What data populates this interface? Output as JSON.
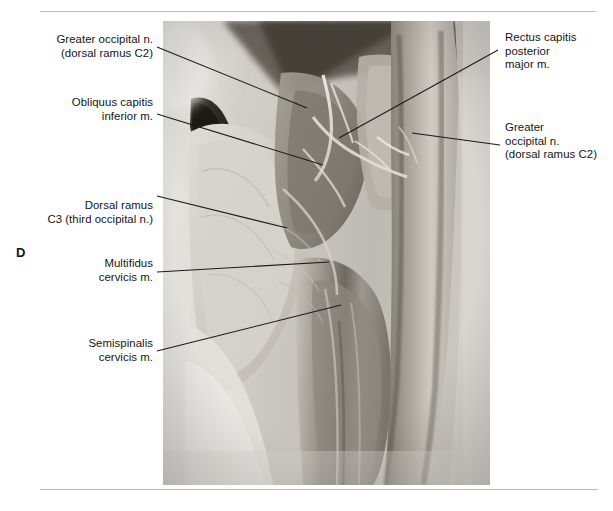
{
  "figure": {
    "panel_letter": "D",
    "rules": {
      "color": "#b9bcc0"
    },
    "photo": {
      "kind": "anatomical-dissection-photograph",
      "description": "Black and white photograph of a posterior suboccipital and posterior cervical dissection"
    }
  },
  "labels": {
    "left": [
      {
        "name": "greater-occipital-nerve-left",
        "lines": [
          "Greater occipital n.",
          "(dorsal ramus C2)"
        ],
        "text": "Greater occipital n.\n(dorsal ramus C2)"
      },
      {
        "name": "obliquus-capitis-inferior",
        "lines": [
          "Obliquus capitis",
          "inferior m."
        ],
        "text": "Obliquus capitis\ninferior m."
      },
      {
        "name": "dorsal-ramus-c3",
        "lines": [
          "Dorsal ramus",
          "C3 (third occipital n.)"
        ],
        "text": "Dorsal ramus\nC3 (third occipital n.)"
      },
      {
        "name": "multifidus-cervicis",
        "lines": [
          "Multifidus",
          "cervicis m."
        ],
        "text": "Multifidus\ncervicis m."
      },
      {
        "name": "semispinalis-cervicis",
        "lines": [
          "Semispinalis",
          "cervicis m."
        ],
        "text": "Semispinalis\ncervicis m."
      }
    ],
    "right": [
      {
        "name": "rectus-capitis-posterior-major",
        "lines": [
          "Rectus capitis",
          "posterior",
          "major m."
        ],
        "text": "Rectus capitis\nposterior\nmajor m."
      },
      {
        "name": "greater-occipital-nerve-right",
        "lines": [
          "Greater",
          "occipital n.",
          "(dorsal ramus C2)"
        ],
        "text": "Greater\noccipital n.\n(dorsal ramus C2)"
      }
    ]
  },
  "leaders": {
    "stroke": "#1a1a1a",
    "items": [
      {
        "name": "leader-greater-occipital-left",
        "x1": 157,
        "y1": 47,
        "x2": 307,
        "y2": 108
      },
      {
        "name": "leader-obliquus-capitis",
        "x1": 157,
        "y1": 114,
        "x2": 323,
        "y2": 165
      },
      {
        "name": "leader-dorsal-ramus-c3",
        "x1": 157,
        "y1": 196,
        "x2": 287,
        "y2": 228
      },
      {
        "name": "leader-multifidus",
        "x1": 157,
        "y1": 272,
        "x2": 329,
        "y2": 262
      },
      {
        "name": "leader-semispinalis",
        "x1": 157,
        "y1": 351,
        "x2": 341,
        "y2": 305
      },
      {
        "name": "leader-rectus-capitis",
        "x1": 498,
        "y1": 50,
        "x2": 339,
        "y2": 138
      },
      {
        "name": "leader-greater-occipital-right",
        "x1": 500,
        "y1": 145,
        "x2": 412,
        "y2": 133
      }
    ]
  }
}
